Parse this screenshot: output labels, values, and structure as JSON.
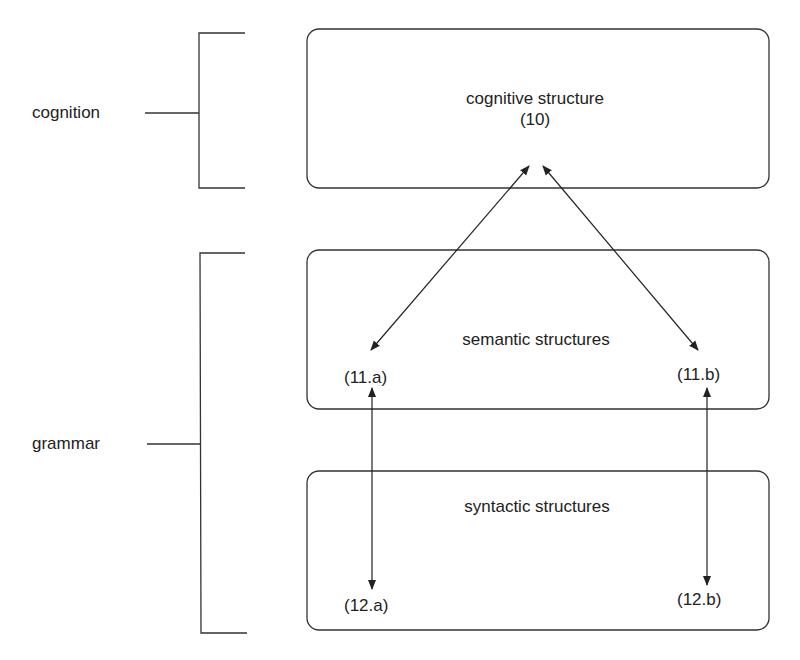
{
  "diagram": {
    "levels": [
      {
        "label": "cognition"
      },
      {
        "label": "grammar"
      }
    ],
    "boxes": [
      {
        "title": "cognitive structure",
        "number": "(10)"
      },
      {
        "title": "semantic structures",
        "left_ref": "(11.a)",
        "right_ref": "(11.b)"
      },
      {
        "title": "syntactic structures",
        "left_ref": "(12.a)",
        "right_ref": "(12.b)"
      }
    ],
    "connections": [
      {
        "from": "(10)",
        "to": "(11.a)",
        "type": "bidirectional"
      },
      {
        "from": "(10)",
        "to": "(11.b)",
        "type": "bidirectional"
      },
      {
        "from": "(11.a)",
        "to": "(12.a)",
        "type": "bidirectional"
      },
      {
        "from": "(11.b)",
        "to": "(12.b)",
        "type": "bidirectional"
      }
    ],
    "colors": {
      "ink": "#222222",
      "background": "#ffffff"
    }
  }
}
